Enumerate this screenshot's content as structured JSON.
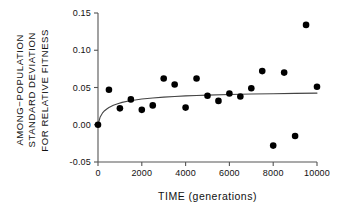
{
  "figure": {
    "background_color": "#ffffff",
    "axis_color": "#555555",
    "marker_color": "#000000",
    "curve_color": "#444444"
  },
  "ylabel_lines": [
    "AMONG−POPULATION",
    "STANDARD DEVIATION",
    "FOR RELATIVE FITNESS"
  ],
  "chart_data": {
    "type": "scatter",
    "title": "",
    "xlabel": "TIME (generations)",
    "ylabel": "AMONG−POPULATION STANDARD DEVIATION FOR RELATIVE FITNESS",
    "xlim": [
      0,
      10000
    ],
    "ylim": [
      -0.05,
      0.15
    ],
    "xticks": [
      0,
      2000,
      4000,
      6000,
      8000,
      10000
    ],
    "xticklabels": [
      "0",
      "2000",
      "4000",
      "6000",
      "8000",
      "10000"
    ],
    "yticks": [
      -0.05,
      0.0,
      0.05,
      0.1,
      0.15
    ],
    "yticklabels": [
      "-0.05",
      "0.00",
      "0.05",
      "0.10",
      "0.15"
    ],
    "grid": false,
    "legend": null,
    "series": [
      {
        "name": "observed standard deviation",
        "type": "scatter",
        "marker": "filled-circle",
        "x": [
          0,
          500,
          1000,
          1500,
          2000,
          2500,
          3000,
          3500,
          4000,
          4500,
          5000,
          5500,
          6000,
          6500,
          7000,
          7500,
          8000,
          8500,
          9000,
          9500,
          10000
        ],
        "y": [
          0.0,
          0.047,
          0.022,
          0.034,
          0.02,
          0.026,
          0.062,
          0.054,
          0.023,
          0.062,
          0.039,
          0.032,
          0.042,
          0.038,
          0.049,
          0.072,
          -0.028,
          0.07,
          -0.015,
          0.134,
          0.051
        ]
      },
      {
        "name": "fitted saturating curve",
        "type": "line",
        "x": [
          0,
          100,
          200,
          300,
          400,
          500,
          700,
          900,
          1100,
          1400,
          1700,
          2000,
          2500,
          3000,
          3500,
          4000,
          4500,
          5000,
          6000,
          7000,
          8000,
          9000,
          10000
        ],
        "y": [
          0.0,
          0.0105,
          0.0155,
          0.0188,
          0.0212,
          0.0232,
          0.0262,
          0.0283,
          0.03,
          0.0319,
          0.0333,
          0.0345,
          0.036,
          0.0371,
          0.038,
          0.0387,
          0.0393,
          0.0398,
          0.0406,
          0.0412,
          0.0417,
          0.0421,
          0.0425
        ]
      }
    ]
  }
}
